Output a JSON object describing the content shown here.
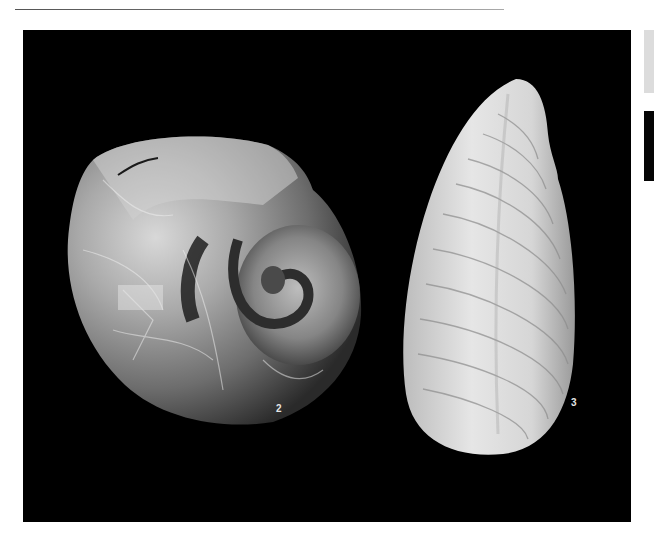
{
  "page": {
    "header_rule": true
  },
  "plate": {
    "background": "#000000",
    "figures": [
      {
        "id": "2",
        "label": "2",
        "subject": "coiled fossil shell (nautiloid/ammonite)"
      },
      {
        "id": "3",
        "label": "3",
        "subject": "elongate fossil bivalve shell with concentric growth lines"
      }
    ]
  },
  "adjacent_plate_edge": {
    "colors": [
      "#dcdcdc",
      "#050505"
    ]
  }
}
